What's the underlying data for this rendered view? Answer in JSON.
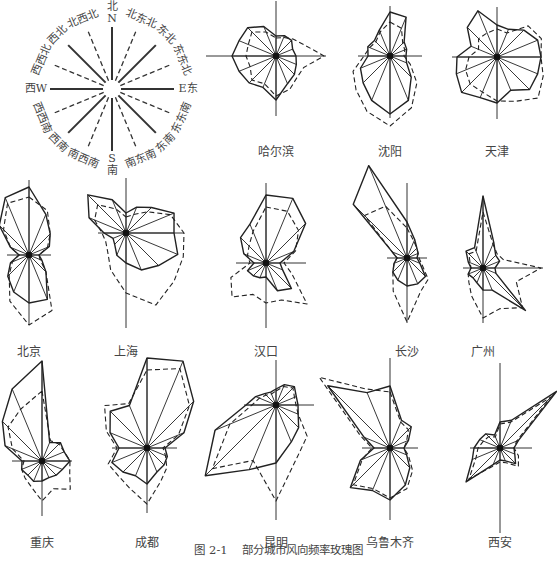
{
  "figure": {
    "number": "图 2-1",
    "caption": "部分城市风向频率玫瑰图"
  },
  "legend_compass": {
    "center": [
      112,
      89
    ],
    "directions": [
      {
        "label": "北\nN",
        "angle": 0,
        "style": "solid"
      },
      {
        "label": "北东北",
        "angle": 22.5,
        "style": "dashed"
      },
      {
        "label": "东北",
        "angle": 45,
        "style": "solid"
      },
      {
        "label": "东东北",
        "angle": 67.5,
        "style": "dashed"
      },
      {
        "label": "E东",
        "angle": 90,
        "style": "solid"
      },
      {
        "label": "东东南",
        "angle": 112.5,
        "style": "dashed"
      },
      {
        "label": "东南",
        "angle": 135,
        "style": "solid"
      },
      {
        "label": "南东南",
        "angle": 157.5,
        "style": "dashed"
      },
      {
        "label": "S\n南",
        "angle": 180,
        "style": "solid"
      },
      {
        "label": "南西南",
        "angle": 202.5,
        "style": "dashed"
      },
      {
        "label": "西南",
        "angle": 225,
        "style": "solid"
      },
      {
        "label": "西西南",
        "angle": 247.5,
        "style": "dashed"
      },
      {
        "label": "西W",
        "angle": 270,
        "style": "solid"
      },
      {
        "label": "西西北",
        "angle": 292.5,
        "style": "dashed"
      },
      {
        "label": "西北",
        "angle": 315,
        "style": "solid"
      },
      {
        "label": "北西北",
        "angle": 337.5,
        "style": "dashed"
      }
    ]
  },
  "chart_data": {
    "type": "radar",
    "title": "部分城市风向频率玫瑰图",
    "axes": [
      "N",
      "NNE",
      "NE",
      "ENE",
      "E",
      "ESE",
      "SE",
      "SSE",
      "S",
      "SSW",
      "SW",
      "WSW",
      "W",
      "WNW",
      "NW",
      "NNW"
    ],
    "series_legend": [
      "solid line",
      "dashed line"
    ],
    "cities": [
      {
        "name": "哈尔滨",
        "center": [
          276,
          56
        ],
        "label_y": 142,
        "ax": [
          55,
          60,
          70,
          50
        ],
        "solid": [
          20,
          22,
          22,
          18,
          20,
          22,
          26,
          30,
          44,
          34,
          38,
          40,
          44,
          40,
          40,
          32
        ],
        "dashed": [
          18,
          20,
          24,
          30,
          48,
          30,
          30,
          36,
          40,
          30,
          34,
          28,
          30,
          30,
          34,
          26
        ]
      },
      {
        "name": "沈阳",
        "center": [
          390,
          56
        ],
        "label_y": 142,
        "ax": [
          50,
          62,
          32,
          32
        ],
        "solid": [
          44,
          42,
          20,
          18,
          16,
          18,
          30,
          48,
          58,
          48,
          38,
          32,
          22,
          24,
          22,
          28
        ],
        "dashed": [
          34,
          30,
          18,
          16,
          14,
          22,
          38,
          56,
          70,
          60,
          48,
          40,
          26,
          22,
          20,
          26
        ],
        "note": "dominant S wind"
      },
      {
        "name": "天津",
        "center": [
          497,
          57
        ],
        "label_y": 142,
        "ax": [
          50,
          62,
          45,
          45
        ],
        "solid": [
          32,
          30,
          38,
          44,
          44,
          44,
          46,
          36,
          46,
          44,
          50,
          44,
          40,
          28,
          42,
          50
        ],
        "dashed": [
          28,
          26,
          44,
          48,
          44,
          50,
          58,
          48,
          44,
          38,
          38,
          34,
          28,
          20,
          26,
          26
        ]
      },
      {
        "name": "北京",
        "center": [
          29,
          255
        ],
        "label_y": 342,
        "ax": [
          75,
          70,
          22,
          22
        ],
        "solid": [
          68,
          44,
          30,
          22,
          10,
          14,
          24,
          48,
          48,
          40,
          30,
          20,
          10,
          20,
          42,
          62
        ],
        "dashed": [
          58,
          48,
          30,
          20,
          10,
          12,
          24,
          60,
          70,
          50,
          28,
          18,
          10,
          20,
          36,
          56
        ]
      },
      {
        "name": "上海",
        "center": [
          126,
          233
        ],
        "label_y": 342,
        "ax": [
          55,
          95,
          28,
          58
        ],
        "solid": [
          20,
          28,
          36,
          52,
          48,
          56,
          46,
          40,
          30,
          24,
          16,
          14,
          22,
          40,
          54,
          36
        ],
        "dashed": [
          16,
          20,
          30,
          48,
          58,
          62,
          68,
          78,
          60,
          40,
          26,
          22,
          24,
          34,
          40,
          26
        ]
      },
      {
        "name": "汉口",
        "center": [
          266,
          263
        ],
        "label_y": 342,
        "ax": [
          80,
          65,
          30,
          40
        ],
        "solid": [
          68,
          70,
          56,
          30,
          14,
          18,
          36,
          30,
          14,
          16,
          18,
          20,
          12,
          24,
          36,
          42
        ],
        "dashed": [
          56,
          56,
          46,
          32,
          18,
          28,
          58,
          40,
          40,
          34,
          48,
          38,
          16,
          20,
          24,
          34
        ]
      },
      {
        "name": "长沙",
        "center": [
          407,
          258
        ],
        "label_y": 342,
        "ax": [
          75,
          65,
          20,
          20
        ],
        "solid": [
          36,
          20,
          14,
          12,
          10,
          14,
          26,
          28,
          28,
          24,
          20,
          14,
          10,
          16,
          76,
          100
        ],
        "dashed": [
          30,
          18,
          14,
          12,
          12,
          16,
          30,
          36,
          64,
          36,
          20,
          14,
          10,
          16,
          60,
          56
        ]
      },
      {
        "name": "广州",
        "center": [
          483,
          268
        ],
        "label_y": 342,
        "ax": [
          70,
          55,
          20,
          60
        ],
        "solid": [
          72,
          28,
          18,
          18,
          12,
          14,
          60,
          24,
          22,
          16,
          14,
          16,
          12,
          16,
          24,
          22
        ],
        "dashed": [
          56,
          26,
          20,
          22,
          58,
          36,
          56,
          44,
          50,
          30,
          20,
          16,
          12,
          14,
          20,
          18
        ]
      },
      {
        "name": "重庆",
        "center": [
          42,
          461
        ],
        "label_y": 533,
        "ax": [
          100,
          55,
          30,
          30
        ],
        "solid": [
          100,
          20,
          26,
          24,
          28,
          22,
          20,
          18,
          20,
          22,
          20,
          22,
          20,
          40,
          56,
          78
        ],
        "dashed": [
          70,
          22,
          24,
          24,
          28,
          30,
          40,
          30,
          40,
          28,
          24,
          22,
          18,
          32,
          48,
          56
        ]
      },
      {
        "name": "成都",
        "center": [
          147,
          448
        ],
        "label_y": 533,
        "ax": [
          90,
          65,
          35,
          30
        ],
        "solid": [
          90,
          94,
          66,
          40,
          18,
          22,
          24,
          26,
          36,
          30,
          34,
          38,
          28,
          40,
          52,
          46
        ],
        "dashed": [
          78,
          86,
          60,
          34,
          16,
          20,
          28,
          36,
          56,
          44,
          40,
          42,
          30,
          44,
          60,
          48
        ]
      },
      {
        "name": "昆明",
        "center": [
          276,
          405
        ],
        "label_y": 533,
        "ax": [
          45,
          115,
          32,
          38
        ],
        "solid": [
          16,
          22,
          26,
          22,
          22,
          24,
          32,
          40,
          58,
          70,
          100,
          66,
          30,
          22,
          16,
          14
        ],
        "dashed": [
          14,
          20,
          24,
          20,
          20,
          24,
          44,
          56,
          96,
          60,
          90,
          50,
          24,
          18,
          14,
          12
        ]
      },
      {
        "name": "乌鲁木齐",
        "center": [
          390,
          448
        ],
        "label_y": 533,
        "ax": [
          90,
          72,
          28,
          28
        ],
        "solid": [
          62,
          30,
          30,
          20,
          14,
          18,
          28,
          40,
          52,
          46,
          56,
          32,
          16,
          28,
          88,
          60
        ],
        "dashed": [
          56,
          28,
          26,
          18,
          14,
          20,
          32,
          44,
          50,
          44,
          52,
          30,
          18,
          32,
          100,
          64
        ]
      },
      {
        "name": "西安",
        "center": [
          500,
          448
        ],
        "label_y": 533,
        "ax": [
          85,
          85,
          30,
          32
        ],
        "solid": [
          26,
          30,
          80,
          20,
          14,
          16,
          22,
          14,
          12,
          18,
          48,
          30,
          26,
          22,
          20,
          14
        ],
        "dashed": [
          24,
          28,
          72,
          18,
          14,
          20,
          26,
          16,
          14,
          20,
          44,
          26,
          22,
          18,
          16,
          12
        ]
      }
    ]
  }
}
